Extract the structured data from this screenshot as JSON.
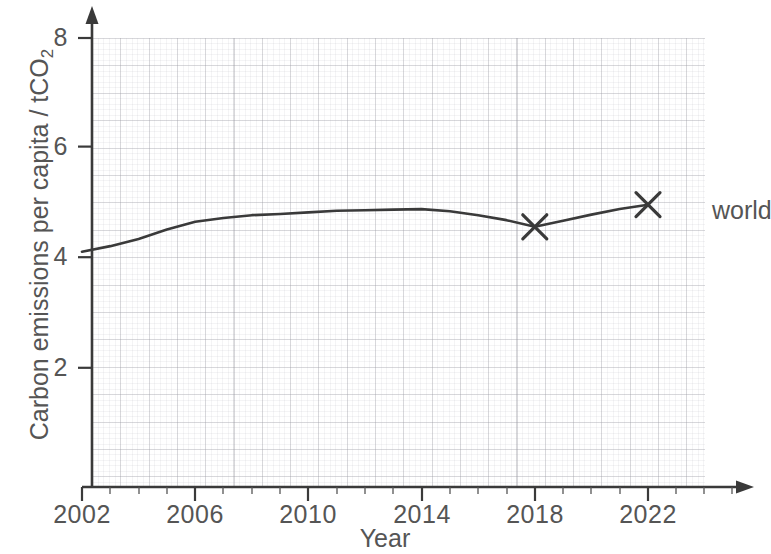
{
  "chart_data": {
    "type": "line",
    "title": "",
    "xlabel": "Year",
    "ylabel": "Carbon emissions per capita / tCO2",
    "ylabel_text": "Carbon emissions per capita / tCO",
    "ylabel_sub": "2",
    "xlim": [
      2002,
      2023.6
    ],
    "ylim": [
      0,
      8.4
    ],
    "x_ticks": [
      2002,
      2006,
      2010,
      2014,
      2018,
      2022
    ],
    "x_tick_labels": [
      "2002",
      "2006",
      "2010",
      "2014",
      "2018",
      "2022"
    ],
    "y_ticks": [
      2,
      4,
      6,
      8
    ],
    "y_tick_labels": [
      "2",
      "4",
      "6",
      "8"
    ],
    "grid": "on",
    "grid_major_x_step": 1,
    "grid_major_y_step": 0.25,
    "legend_position": "right-of-line-end",
    "series": [
      {
        "name": "world",
        "label": "world",
        "color": "#3a3a3a",
        "marker": "x",
        "marker_points": [
          {
            "x": 2018,
            "y": 4.55
          },
          {
            "x": 2022,
            "y": 4.95
          }
        ],
        "x": [
          2002,
          2003,
          2004,
          2005,
          2006,
          2007,
          2008,
          2009,
          2010,
          2011,
          2012,
          2013,
          2014,
          2015,
          2016,
          2017,
          2018,
          2019,
          2020,
          2021,
          2022
        ],
        "values": [
          4.1,
          4.2,
          4.33,
          4.5,
          4.64,
          4.71,
          4.76,
          4.78,
          4.81,
          4.84,
          4.85,
          4.86,
          4.87,
          4.83,
          4.76,
          4.67,
          4.55,
          4.66,
          4.77,
          4.87,
          4.95
        ]
      }
    ]
  },
  "axis": {
    "x_arrow": true,
    "y_arrow": true,
    "line_color": "#3a3a3a"
  }
}
